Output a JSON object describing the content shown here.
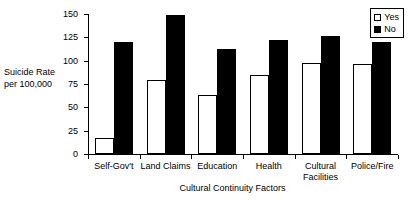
{
  "chart_data": {
    "type": "bar",
    "title": "",
    "xlabel": "Cultural Continuity Factors",
    "ylabel": "Suicide Rate per 100,000",
    "ylabel_lines": [
      "Suicide Rate",
      "per 100,000"
    ],
    "ylim": [
      0,
      150
    ],
    "yticks": [
      0,
      25,
      50,
      75,
      100,
      125,
      150
    ],
    "ytick_labels": [
      "0",
      "25",
      "50",
      "75",
      "100",
      "125",
      "150"
    ],
    "grid": false,
    "legend_position": "top-right",
    "categories": [
      "Self-Gov't",
      "Land Claims",
      "Education",
      "Health",
      "Cultural Facilities",
      "Police/Fire"
    ],
    "category_label_lines": [
      [
        "Self-Gov't"
      ],
      [
        "Land Claims"
      ],
      [
        "Education"
      ],
      [
        "Health"
      ],
      [
        "Cultural",
        "Facilities"
      ],
      [
        "Police/Fire"
      ]
    ],
    "series": [
      {
        "name": "Yes",
        "color": "#ffffff",
        "edge_color": "#000000",
        "values": [
          17,
          79,
          63,
          85,
          97,
          96
        ]
      },
      {
        "name": "No",
        "color": "#000000",
        "edge_color": "#000000",
        "values": [
          120,
          149,
          113,
          122,
          126,
          120
        ]
      }
    ]
  },
  "legend": {
    "items": [
      {
        "label": "Yes",
        "swatch": "hollow-square"
      },
      {
        "label": "No",
        "swatch": "filled-square"
      }
    ]
  },
  "axes": {
    "y_title_line1": "Suicide Rate",
    "y_title_line2": "per 100,000",
    "x_title": "Cultural Continuity Factors",
    "ytick_0": "0",
    "ytick_25": "25",
    "ytick_50": "50",
    "ytick_75": "75",
    "ytick_100": "100",
    "ytick_125": "125",
    "ytick_150": "150"
  }
}
